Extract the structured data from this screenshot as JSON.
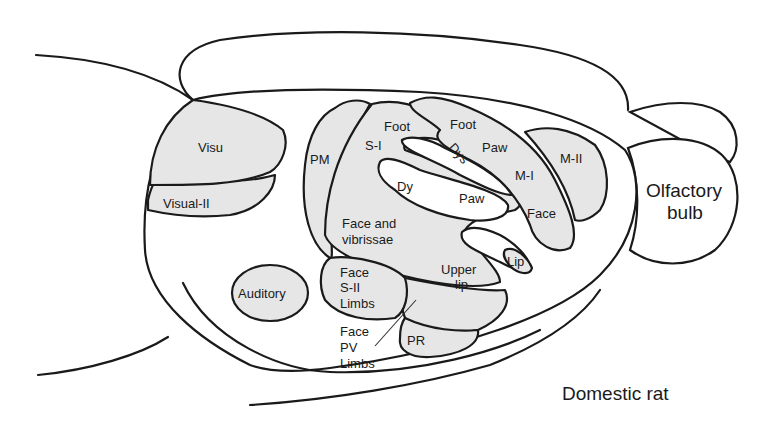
{
  "diagram": {
    "title": "Domestic rat",
    "structures": {
      "olfactory_bulb": "Olfactory bulb",
      "olfactory_line1": "Olfactory",
      "olfactory_line2": "bulb"
    },
    "regions": {
      "visu": "Visu",
      "visual_ii": "Visual-II",
      "auditory": "Auditory",
      "pm": "PM",
      "s_i": "S-I",
      "foot_si": "Foot",
      "dy": "Dy",
      "dys": "Dys",
      "paw_si": "Paw",
      "face_vibrissae_line1": "Face and",
      "face_vibrissae_line2": "vibrissae",
      "foot_mi": "Foot",
      "paw_mi": "Paw",
      "m_i": "M-I",
      "face_mi": "Face",
      "m_ii": "M-II",
      "lip": "Lip",
      "upper_lip_line1": "Upper",
      "upper_lip_line2": "lip",
      "sii_line1": "Face",
      "sii_line2": "S-II",
      "sii_line3": "Limbs",
      "pv_line1": "Face",
      "pv_line2": "PV",
      "pv_line3": "Limbs",
      "pr": "PR"
    },
    "colors": {
      "region_fill": "#e6e6e6",
      "outline": "#1a1a1a",
      "background": "#ffffff"
    }
  }
}
